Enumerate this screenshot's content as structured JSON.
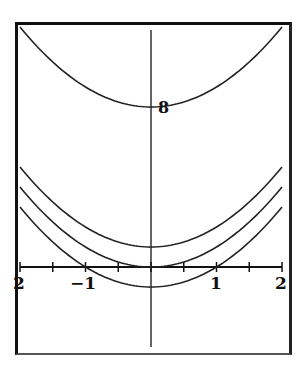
{
  "chart_data": {
    "type": "line",
    "title": "",
    "xlabel": "",
    "ylabel": "",
    "xlim": [
      -2,
      2
    ],
    "ylim": [
      -4.2,
      12.2
    ],
    "grid": false,
    "legend": null,
    "x_ticks": [
      -2,
      -1.5,
      -1,
      -0.5,
      0,
      0.5,
      1,
      1.5,
      2
    ],
    "x_tick_labels": [
      "2",
      "−1",
      "1",
      "2"
    ],
    "series": [
      {
        "name": "y = x^2 + 8",
        "c": 8,
        "x": [
          -2,
          -1,
          0,
          1,
          2
        ],
        "values": [
          12,
          9,
          8,
          9,
          12
        ]
      },
      {
        "name": "y = x^2 + 1",
        "c": 1,
        "x": [
          -2,
          -1,
          0,
          1,
          2
        ],
        "values": [
          5,
          2,
          1,
          2,
          5
        ]
      },
      {
        "name": "y = x^2",
        "c": 0,
        "x": [
          -2,
          -1,
          0,
          1,
          2
        ],
        "values": [
          4,
          1,
          0,
          1,
          4
        ]
      },
      {
        "name": "y = x^2 - 1",
        "c": -1,
        "x": [
          -2,
          -1,
          0,
          1,
          2
        ],
        "values": [
          3,
          0,
          -1,
          0,
          3
        ]
      }
    ],
    "annotations": [
      {
        "text": "8",
        "x": 0,
        "y": 8
      }
    ]
  },
  "labels": {
    "x_left": "2",
    "x_neg1": "−1",
    "x_pos1": "1",
    "x_right": "2",
    "vertex_annotation": "8"
  },
  "colors": {
    "curve": "#222222",
    "axis": "#111111",
    "frame": "#111111"
  }
}
